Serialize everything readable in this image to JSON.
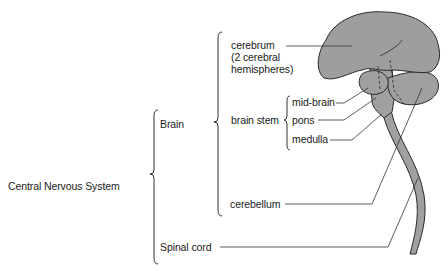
{
  "diagram": {
    "type": "hierarchical-anatomy-diagram",
    "root": "Central Nervous System",
    "labels": {
      "cns": "Central Nervous System",
      "brain": "Brain",
      "spinal_cord": "Spinal cord",
      "cerebrum_line1": "cerebrum",
      "cerebrum_line2": "(2 cerebral",
      "cerebrum_line3": "hemispheres)",
      "brain_stem": "brain stem",
      "mid_brain": "mid-brain",
      "pons": "pons",
      "medulla": "medulla",
      "cerebellum": "cerebellum"
    },
    "hierarchy": {
      "Central Nervous System": {
        "Brain": {
          "cerebrum (2 cerebral hemispheres)": {},
          "brain stem": {
            "mid-brain": {},
            "pons": {},
            "medulla": {}
          },
          "cerebellum": {}
        },
        "Spinal cord": {}
      }
    },
    "colors": {
      "tissue_fill": "#9e9e9e",
      "outline": "#2a2a2a",
      "leader_line": "#333333"
    }
  }
}
